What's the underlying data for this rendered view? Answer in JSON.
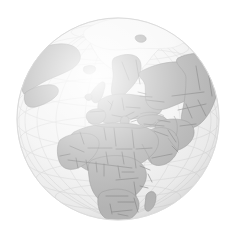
{
  "figure": {
    "title": "Orthographic projection of Earth centred on Europe and Africa",
    "caption": "Grayscale world globe",
    "type": "orthographic-globe-map"
  },
  "projection": {
    "name": "orthographic",
    "center_longitude": "20°E",
    "center_latitude": "20°N",
    "graticule_spacing_degrees": "15",
    "graticule_visible": "true",
    "sphere_radius_px": "101",
    "sphere_center_x_px": "118",
    "sphere_center_y_px": "119"
  },
  "colors": {
    "background": "#ffffff",
    "ocean": "#f2f2f2",
    "ocean_edge": "#e2e2e2",
    "land": "#ababab",
    "land_ice": "#f6f6f6",
    "country_border": "#6f6f6f",
    "coastline": "#8a8a8a",
    "graticule": "#d8d8d8",
    "sphere_outline": "#dcdcdc",
    "shading_highlight": "#ffffff",
    "shading_shadow": "#c9c9c9"
  },
  "legend": {
    "visible": "false",
    "entries": [
      {
        "label": "Land",
        "color": "#ababab"
      },
      {
        "label": "Ocean",
        "color": "#f2f2f2"
      },
      {
        "label": "Ice sheet",
        "color": "#f6f6f6"
      }
    ]
  },
  "regions_visible": [
    "Greenland",
    "Iceland",
    "Svalbard",
    "Scandinavia",
    "British Isles",
    "Western Europe",
    "Eastern Europe",
    "Mediterranean Sea",
    "North Africa",
    "Sahara",
    "West Africa",
    "Central Africa",
    "East Africa",
    "Southern Africa",
    "Madagascar",
    "Arabian Peninsula",
    "Middle East",
    "Caspian Sea",
    "Black Sea",
    "Central Asia",
    "Western Russia",
    "Siberia",
    "Northeast Canada",
    "Atlantic Ocean",
    "Indian Ocean",
    "Arctic Ocean"
  ],
  "annotations": {
    "labels_visible": "false",
    "scale_bar_visible": "false",
    "north_arrow_visible": "false"
  }
}
